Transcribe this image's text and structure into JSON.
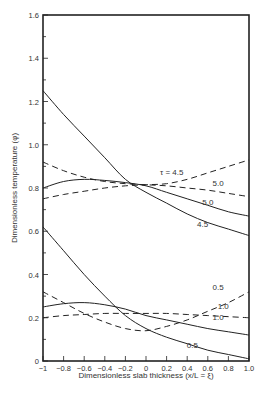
{
  "chart_data": {
    "type": "line",
    "title": "",
    "xlabel": "Dimensionless slab thickness (x/L = ξ)",
    "ylabel": "Dimensionless temperature (φ)",
    "xlim": [
      -1,
      1
    ],
    "ylim": [
      0,
      1.6
    ],
    "x_ticks": [
      "-1",
      "-0.8",
      "-0.6",
      "-0.4",
      "-0.2",
      "0",
      "0.2",
      "0.4",
      "0.6",
      "0.8",
      "1.0"
    ],
    "y_ticks": [
      "0",
      "0.2",
      "0.4",
      "0.6",
      "0.8",
      "1.0",
      "1.2",
      "1.4",
      "1.6"
    ],
    "grid": false,
    "legend": "inline curve labels",
    "x": [
      -1,
      -0.8,
      -0.6,
      -0.4,
      -0.2,
      0,
      0.2,
      0.4,
      0.6,
      0.8,
      1.0
    ],
    "series": [
      {
        "name": "τ = 4.5 (solid)",
        "style": "solid",
        "label": "4.5",
        "values": [
          1.25,
          1.14,
          1.04,
          0.94,
          0.84,
          0.78,
          0.73,
          0.68,
          0.64,
          0.61,
          0.58
        ]
      },
      {
        "name": "τ = 5.0 (solid)",
        "style": "solid",
        "label": "5.0",
        "values": [
          0.8,
          0.83,
          0.84,
          0.835,
          0.825,
          0.81,
          0.78,
          0.75,
          0.72,
          0.69,
          0.67
        ]
      },
      {
        "name": "τ = 4.5 (dashed)",
        "style": "dashed",
        "label": "τ = 4.5",
        "values": [
          0.75,
          0.77,
          0.785,
          0.8,
          0.81,
          0.815,
          0.82,
          0.84,
          0.87,
          0.9,
          0.93
        ]
      },
      {
        "name": "τ = 5.0 (dashed)",
        "style": "dashed",
        "label": "5.0",
        "values": [
          0.92,
          0.88,
          0.85,
          0.83,
          0.82,
          0.815,
          0.81,
          0.8,
          0.79,
          0.775,
          0.76
        ]
      },
      {
        "name": "τ = 0.5 (solid)",
        "style": "solid",
        "label": "0.5",
        "values": [
          0.62,
          0.51,
          0.4,
          0.3,
          0.21,
          0.15,
          0.11,
          0.08,
          0.05,
          0.03,
          0.01
        ]
      },
      {
        "name": "τ = 1.0 (solid)",
        "style": "solid",
        "label": "1.0",
        "values": [
          0.25,
          0.265,
          0.27,
          0.26,
          0.24,
          0.21,
          0.19,
          0.17,
          0.15,
          0.135,
          0.12
        ]
      },
      {
        "name": "τ = 0.5 (dashed)",
        "style": "dashed",
        "label": "0.5",
        "values": [
          0.32,
          0.27,
          0.22,
          0.18,
          0.15,
          0.14,
          0.16,
          0.19,
          0.23,
          0.27,
          0.32
        ]
      },
      {
        "name": "τ = 1.0 (dashed)",
        "style": "dashed",
        "label": "1.0",
        "values": [
          0.2,
          0.21,
          0.215,
          0.22,
          0.22,
          0.22,
          0.22,
          0.215,
          0.21,
          0.205,
          0.2
        ]
      }
    ],
    "annotations": [
      {
        "text": "τ = 4.5",
        "x": 0.25,
        "y": 0.86
      },
      {
        "text": "5.0",
        "x": 0.7,
        "y": 0.81
      },
      {
        "text": "5.0",
        "x": 0.6,
        "y": 0.72
      },
      {
        "text": "4.5",
        "x": 0.55,
        "y": 0.62
      },
      {
        "text": "0.5",
        "x": 0.7,
        "y": 0.33
      },
      {
        "text": "1.0",
        "x": 0.75,
        "y": 0.24
      },
      {
        "text": "1.0",
        "x": 0.7,
        "y": 0.19
      },
      {
        "text": "0.5",
        "x": 0.45,
        "y": 0.06
      }
    ]
  }
}
